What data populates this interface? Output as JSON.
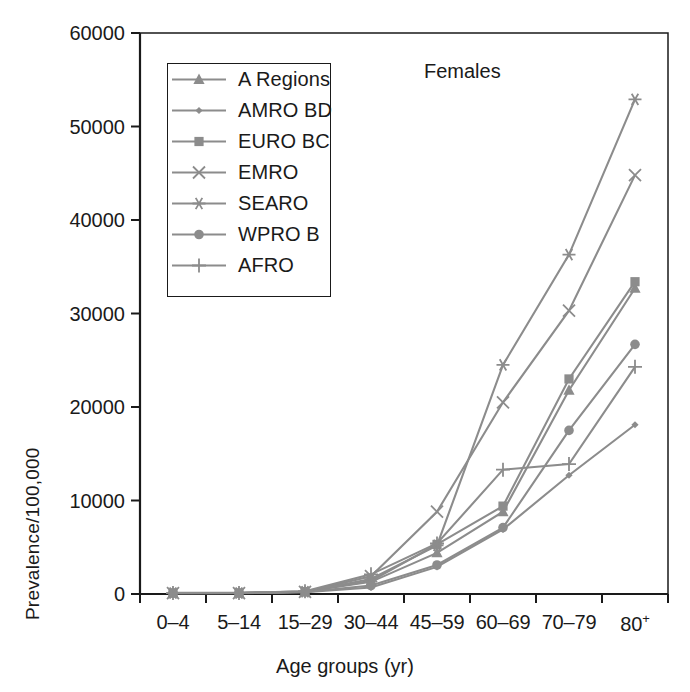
{
  "figure": {
    "panel_title": "Females",
    "axis": {
      "ylabel": "Prevalence/100,000",
      "xlabel": "Age groups (yr)",
      "yticks": [
        "0",
        "10000",
        "20000",
        "30000",
        "40000",
        "50000",
        "60000"
      ],
      "xticks": [
        "0–4",
        "5–14",
        "15–29",
        "30–44",
        "45–59",
        "60–69",
        "70–79",
        "80+"
      ]
    },
    "legend": {
      "items": [
        {
          "label": "A Regions",
          "marker": "triangle"
        },
        {
          "label": "AMRO BD",
          "marker": "small-diamond"
        },
        {
          "label": "EURO BC",
          "marker": "square"
        },
        {
          "label": "EMRO",
          "marker": "cross-x"
        },
        {
          "label": "SEARO",
          "marker": "asterisk"
        },
        {
          "label": "WPRO B",
          "marker": "circle"
        },
        {
          "label": "AFRO",
          "marker": "plus"
        }
      ]
    },
    "colors": {
      "line": "#8c8c8c",
      "marker": "#8c8c8c",
      "axis": "#1a1a1a",
      "text": "#1a1a1a",
      "background": "#ffffff"
    }
  },
  "chart_data": {
    "type": "line",
    "title": "Females",
    "xlabel": "Age groups (yr)",
    "ylabel": "Prevalence/100,000",
    "categories": [
      "0–4",
      "5–14",
      "15–29",
      "30–44",
      "45–59",
      "60–69",
      "70–79",
      "80+"
    ],
    "ylim": [
      0,
      60000
    ],
    "ytick_values": [
      0,
      10000,
      20000,
      30000,
      40000,
      50000,
      60000
    ],
    "grid": false,
    "legend_position": "upper-left-inside",
    "series": [
      {
        "name": "A Regions",
        "marker": "triangle",
        "values": [
          120,
          120,
          250,
          1300,
          4400,
          8800,
          21800,
          32700
        ]
      },
      {
        "name": "AMRO BD",
        "marker": "small-diamond",
        "values": [
          80,
          90,
          200,
          700,
          2900,
          6900,
          12700,
          18100
        ]
      },
      {
        "name": "EURO BC",
        "marker": "square",
        "values": [
          110,
          110,
          260,
          1400,
          5300,
          9400,
          23000,
          33400
        ]
      },
      {
        "name": "EMRO",
        "marker": "cross-x",
        "values": [
          100,
          100,
          230,
          1900,
          8800,
          20500,
          30300,
          44800
        ]
      },
      {
        "name": "SEARO",
        "marker": "asterisk",
        "values": [
          100,
          100,
          240,
          1600,
          5200,
          24500,
          36300,
          52900
        ]
      },
      {
        "name": "WPRO B",
        "marker": "circle",
        "values": [
          90,
          100,
          210,
          900,
          3100,
          7100,
          17500,
          26700
        ]
      },
      {
        "name": "AFRO",
        "marker": "plus",
        "values": [
          100,
          100,
          300,
          2100,
          5400,
          13300,
          13900,
          24300
        ]
      }
    ]
  }
}
